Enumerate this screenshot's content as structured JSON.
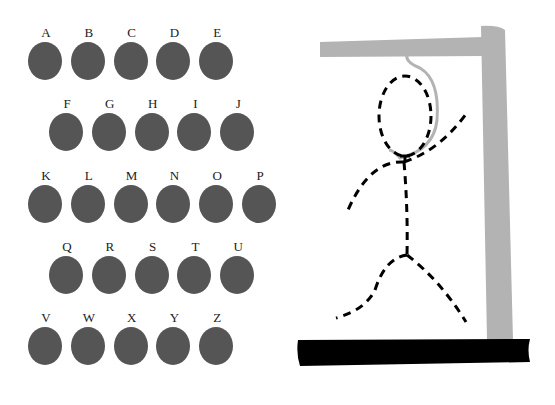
{
  "game": "hangman",
  "letters": {
    "rows": [
      [
        "A",
        "B",
        "C",
        "D",
        "E"
      ],
      [
        "F",
        "G",
        "H",
        "I",
        "J"
      ],
      [
        "K",
        "L",
        "M",
        "N",
        "O",
        "P"
      ],
      [
        "Q",
        "R",
        "S",
        "T",
        "U"
      ],
      [
        "V",
        "W",
        "X",
        "Y",
        "Z"
      ]
    ]
  },
  "colors": {
    "letter_ball": "#555555",
    "gallows": "#b3b3b3",
    "base": "#000000",
    "figure": "#000000",
    "rope": "#b3b3b3"
  },
  "figure": {
    "parts_drawn": [
      "head",
      "body",
      "left-arm",
      "right-arm",
      "left-leg",
      "right-leg"
    ],
    "style": "dashed"
  }
}
